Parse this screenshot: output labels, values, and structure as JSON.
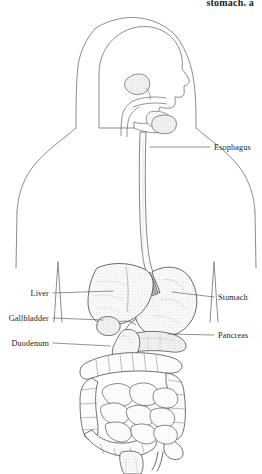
{
  "caption": {
    "fragment_text": "stomach, a"
  },
  "figure": {
    "view": "anterior torso with head in profile",
    "style": "pen-and-ink stipple line drawing",
    "colors": {
      "outline": "#6e6e70",
      "organ_line": "#4a4a4c",
      "stipple": "#b9b9bc",
      "fill_light": "#f4f4f2",
      "leader_line": "#58585a",
      "text": "#20201f",
      "background": "#ffffff"
    }
  },
  "labels": [
    {
      "id": "esophagus",
      "text": "Esophagus",
      "side": "right",
      "text_x": 214,
      "text_y": 150,
      "leader_x1": 210,
      "leader_y1": 147,
      "leader_x2": 150,
      "leader_y2": 147
    },
    {
      "id": "stomach",
      "text": "Stomach",
      "side": "right",
      "text_x": 218,
      "text_y": 300,
      "leader_x1": 214,
      "leader_y1": 297,
      "leader_x2": 172,
      "leader_y2": 292
    },
    {
      "id": "pancreas",
      "text": "Pancreas",
      "side": "right",
      "text_x": 218,
      "text_y": 338,
      "leader_x1": 214,
      "leader_y1": 335,
      "leader_x2": 168,
      "leader_y2": 334
    },
    {
      "id": "liver",
      "text": "Liver",
      "side": "left",
      "text_x": 49,
      "text_y": 296,
      "leader_x1": 53,
      "leader_y1": 293,
      "leader_x2": 113,
      "leader_y2": 291
    },
    {
      "id": "gallbladder",
      "text": "Gallbladder",
      "side": "left",
      "text_x": 49,
      "text_y": 321,
      "leader_x1": 53,
      "leader_y1": 318,
      "leader_x2": 103,
      "leader_y2": 320
    },
    {
      "id": "duodenum",
      "text": "Duodenum",
      "side": "left",
      "text_x": 49,
      "text_y": 346,
      "leader_x1": 53,
      "leader_y1": 343,
      "leader_x2": 110,
      "leader_y2": 346
    }
  ],
  "organs": [
    {
      "id": "head-profile",
      "name": "Head in profile"
    },
    {
      "id": "oral-cavity",
      "name": "Oral cavity and tongue"
    },
    {
      "id": "salivary-glands",
      "name": "Salivary glands"
    },
    {
      "id": "esophagus-tube",
      "name": "Esophagus"
    },
    {
      "id": "stomach-body",
      "name": "Stomach"
    },
    {
      "id": "liver-body",
      "name": "Liver"
    },
    {
      "id": "gallbladder-body",
      "name": "Gallbladder"
    },
    {
      "id": "pancreas-body",
      "name": "Pancreas"
    },
    {
      "id": "duodenum-body",
      "name": "Duodenum"
    },
    {
      "id": "large-intestine",
      "name": "Large intestine (colon)"
    },
    {
      "id": "small-intestine",
      "name": "Small intestine"
    },
    {
      "id": "appendix",
      "name": "Appendix"
    },
    {
      "id": "rectum",
      "name": "Rectum"
    },
    {
      "id": "torso-outline",
      "name": "Body outline"
    }
  ]
}
